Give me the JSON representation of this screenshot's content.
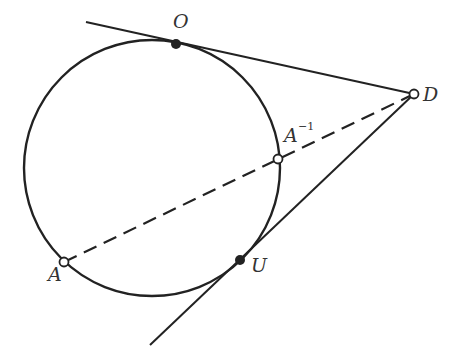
{
  "diagram": {
    "colors": {
      "stroke": "#222222",
      "background": "#ffffff",
      "label": "#333333"
    },
    "circle": {
      "cx": 152,
      "cy": 168,
      "r": 128
    },
    "points": {
      "O": {
        "label": "O",
        "x": 176,
        "y": 44,
        "style": "filled"
      },
      "D": {
        "label": "D",
        "x": 414,
        "y": 94,
        "style": "open"
      },
      "A_inv": {
        "label": "A",
        "sup": "−1",
        "x": 278,
        "y": 159,
        "style": "open"
      },
      "A": {
        "label": "A",
        "x": 64,
        "y": 262,
        "style": "open"
      },
      "U": {
        "label": "U",
        "x": 240,
        "y": 260,
        "style": "filled"
      }
    },
    "lines": [
      {
        "name": "tangent-O-D",
        "x1": 86,
        "y1": 22,
        "x2": 414,
        "y2": 94,
        "style": "solid"
      },
      {
        "name": "tangent-U-D",
        "x1": 150,
        "y1": 345,
        "x2": 414,
        "y2": 94,
        "style": "solid"
      },
      {
        "name": "secant-A-D",
        "x1": 64,
        "y1": 262,
        "x2": 414,
        "y2": 94,
        "style": "dashed"
      }
    ]
  }
}
